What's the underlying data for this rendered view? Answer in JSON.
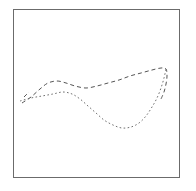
{
  "figure": {
    "background_color": "#ffffff",
    "frame": {
      "x": 13,
      "y": 9,
      "width": 167,
      "height": 169,
      "border_color": "#6b6b6b",
      "border_width": 1
    }
  },
  "chart_data": {
    "type": "line",
    "title": "",
    "xlabel": "",
    "ylabel": "",
    "grid": false,
    "legend": null,
    "axis_visible": false,
    "tick_labels": [],
    "xlim": [
      13,
      180
    ],
    "ylim": [
      178,
      9
    ],
    "series": [
      {
        "name": "upper-dashed-curve",
        "style": "dashed",
        "color": "#555555",
        "dash_pattern": "4 3",
        "line_width": 1,
        "points": [
          [
            22,
            103
          ],
          [
            31,
            97
          ],
          [
            40,
            89
          ],
          [
            48,
            83
          ],
          [
            57,
            81
          ],
          [
            66,
            83
          ],
          [
            75,
            86
          ],
          [
            86,
            88
          ],
          [
            97,
            86
          ],
          [
            108,
            83
          ],
          [
            119,
            80
          ],
          [
            130,
            76
          ],
          [
            141,
            73
          ],
          [
            152,
            70
          ],
          [
            161,
            68
          ],
          [
            166,
            69
          ],
          [
            167,
            76
          ],
          [
            166,
            84
          ],
          [
            164,
            92
          ],
          [
            161,
            99
          ]
        ]
      },
      {
        "name": "lower-dotted-curve",
        "style": "dotted",
        "color": "#707070",
        "dash_pattern": "1.6 2.4",
        "line_width": 1,
        "points": [
          [
            20,
            101
          ],
          [
            31,
            98
          ],
          [
            42,
            96
          ],
          [
            53,
            94
          ],
          [
            63,
            92
          ],
          [
            72,
            94
          ],
          [
            80,
            99
          ],
          [
            88,
            106
          ],
          [
            96,
            113
          ],
          [
            104,
            120
          ],
          [
            113,
            125
          ],
          [
            122,
            128
          ],
          [
            131,
            127
          ],
          [
            139,
            123
          ],
          [
            146,
            116
          ],
          [
            152,
            107
          ],
          [
            157,
            98
          ],
          [
            161,
            88
          ],
          [
            164,
            78
          ],
          [
            166,
            69
          ]
        ]
      },
      {
        "name": "left-short-dash-stub",
        "style": "dashed",
        "color": "#555555",
        "dash_pattern": "4 3",
        "line_width": 1,
        "points": [
          [
            24,
            97
          ],
          [
            29,
            92
          ]
        ]
      }
    ],
    "annotations": []
  }
}
